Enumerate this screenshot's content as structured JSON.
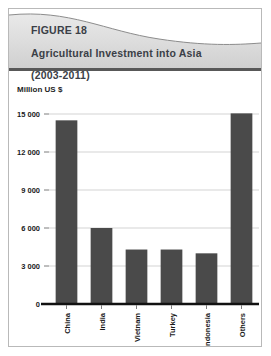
{
  "figure": {
    "label": "FIGURE 18",
    "title": "Agricultural Investment into Asia",
    "period": "(2003-2011)",
    "unit_label": "Million US $",
    "accent_color": "#4a4a4a",
    "header_bg_color": "#dcdcdc",
    "header_text_color": "#3b3f47"
  },
  "chart_data": {
    "type": "bar",
    "title": "Agricultural Investment into Asia (2003-2011)",
    "xlabel": "",
    "ylabel": "Million US $",
    "categories": [
      "China",
      "India",
      "Vietnam",
      "Turkey",
      "Indonesia",
      "Others"
    ],
    "values": [
      14500,
      6000,
      4300,
      4300,
      4000,
      15050
    ],
    "ylim": [
      0,
      15000
    ],
    "yticks": [
      0,
      3000,
      6000,
      9000,
      12000,
      15000
    ],
    "ytick_labels": [
      "0",
      "3 000",
      "6 000",
      "9 000",
      "12 000",
      "15 000"
    ],
    "grid": true,
    "legend": "none",
    "series": [
      {
        "name": "Agricultural Investment",
        "color": "#4a4a4a",
        "values": [
          14500,
          6000,
          4300,
          4300,
          4000,
          15050
        ]
      }
    ]
  }
}
